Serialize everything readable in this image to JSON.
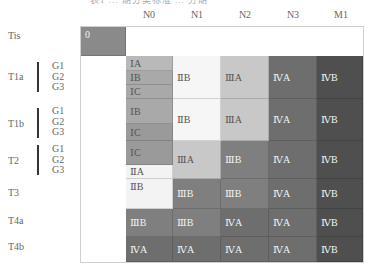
{
  "clipped_title": "表1   ...   期分类标准 ...   分期",
  "columns": [
    "N0",
    "N1",
    "N2",
    "N3",
    "M1"
  ],
  "rows": [
    {
      "label": "Tis",
      "grades": []
    },
    {
      "label": "T1a",
      "grades": [
        "G1",
        "G2",
        "G3"
      ]
    },
    {
      "label": "T1b",
      "grades": [
        "G1",
        "G2",
        "G3"
      ]
    },
    {
      "label": "T2",
      "grades": [
        "G1",
        "G2",
        "G3"
      ]
    },
    {
      "label": "T3",
      "grades": []
    },
    {
      "label": "T4a",
      "grades": []
    },
    {
      "label": "T4b",
      "grades": []
    }
  ],
  "colors": {
    "stage0": "#8a8a8a",
    "stageIA": "#b9b9b9",
    "stageIB": "#a9a9a9",
    "stageIC": "#9a9a9a",
    "stageIIA": "#f3f3f3",
    "stageIIB": "#f6f6f6",
    "stageIIIA": "#c8c8c8",
    "stageIIIB": "#7f7f7f",
    "stageIVA": "#6e6e6e",
    "stageIVB": "#4f4f4f"
  },
  "cells": {
    "tis_n0": "0",
    "t1a_n0_g1": "ⅠA",
    "t1a_n0_g2": "ⅠB",
    "t1a_n0_g3": "ⅠC",
    "t1a_n1": "ⅡB",
    "t1a_n2": "ⅢA",
    "t1a_n3": "ⅣA",
    "t1a_m1": "ⅣB",
    "t1b_n0_g12": "ⅠB",
    "t1b_n0_g3": "ⅠC",
    "t1b_n1": "ⅡB",
    "t1b_n2": "ⅢA",
    "t1b_n3": "ⅣA",
    "t1b_m1": "ⅣB",
    "t2_n0_g12": "ⅠC",
    "t2_n0_g3": "ⅡA",
    "t2_n1": "ⅢA",
    "t2_n2": "ⅢB",
    "t2_n3": "ⅣA",
    "t2_m1": "ⅣB",
    "t3_n0": "ⅡB",
    "t3_n1": "ⅢB",
    "t3_n2": "ⅢB",
    "t3_n3": "ⅣA",
    "t3_m1": "ⅣB",
    "t4a_n0": "ⅢB",
    "t4a_n1": "ⅢB",
    "t4a_n2": "ⅣA",
    "t4a_n3": "ⅣA",
    "t4a_m1": "ⅣB",
    "t4b_n0": "ⅣA",
    "t4b_n1": "ⅣA",
    "t4b_n2": "ⅣA",
    "t4b_n3": "ⅣA",
    "t4b_m1": "ⅣB"
  }
}
